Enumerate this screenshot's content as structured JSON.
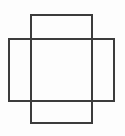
{
  "canvas": {
    "width": 125,
    "height": 136,
    "background_color": "#fdfdfd",
    "page_background_color": "#ffffff"
  },
  "figure": {
    "stroke_color": "#3c3c3c",
    "stroke_width": 1.6,
    "fill": "none"
  },
  "chart_data": {
    "type": "diagram",
    "xlabel": "",
    "ylabel": "",
    "xlim": [
      0,
      125
    ],
    "ylim": [
      0,
      136
    ],
    "grid": false,
    "legend": "none",
    "units": "pixels",
    "shapes": [
      {
        "name": "tall-rectangle",
        "kind": "rectangle",
        "orientation": "vertical",
        "x": 31,
        "y": 15,
        "width": 61,
        "height": 108,
        "x2": 92,
        "y2": 123,
        "stroke": "#3c3c3c",
        "stroke_width": 1.6,
        "fill": "none",
        "z_order": 1
      },
      {
        "name": "wide-rectangle",
        "kind": "rectangle",
        "orientation": "horizontal",
        "x": 9,
        "y": 39,
        "width": 105,
        "height": 62,
        "x2": 114,
        "y2": 101,
        "stroke": "#3c3c3c",
        "stroke_width": 1.6,
        "fill": "none",
        "z_order": 2
      }
    ],
    "intersection": {
      "name": "overlap-region",
      "x": 31,
      "y": 39,
      "width": 61,
      "height": 62,
      "x2": 92,
      "y2": 101
    }
  }
}
